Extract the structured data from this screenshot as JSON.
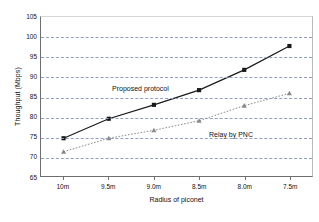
{
  "chart_data": {
    "type": "line",
    "title": "",
    "xlabel": "Radius of piconet",
    "ylabel": "Thoughput  (Mbps)",
    "categories": [
      "10m",
      "9.5m",
      "9.0m",
      "8.5m",
      "8.0m",
      "7.5m"
    ],
    "ytick_labels": [
      "105",
      "100",
      "95",
      "90",
      "85",
      "80",
      "75",
      "70",
      "65"
    ],
    "ylim": [
      65,
      105
    ],
    "ytick_step": 5,
    "grid": "horizontal-dashed",
    "legend": "inline-annotations",
    "series": [
      {
        "name": "Proposed protocol",
        "marker": "square",
        "line": "solid",
        "color": "#1a1a1a",
        "values": [
          74.5,
          79.4,
          82.9,
          86.6,
          91.7,
          97.7
        ]
      },
      {
        "name": "Relay by PNC",
        "marker": "triangle",
        "line": "dotted",
        "color": "#8a8a8a",
        "values": [
          71.1,
          74.5,
          76.5,
          78.9,
          82.7,
          85.8
        ]
      }
    ],
    "annotations": [
      {
        "text": "Proposed protocol"
      },
      {
        "text": "Relay by PNC"
      }
    ]
  },
  "colors": {
    "grid": "#8f9fc0",
    "axis": "#6e6e6e",
    "series_primary": "#1a1a1a",
    "series_secondary": "#8a8a8a",
    "background": "#ffffff"
  }
}
